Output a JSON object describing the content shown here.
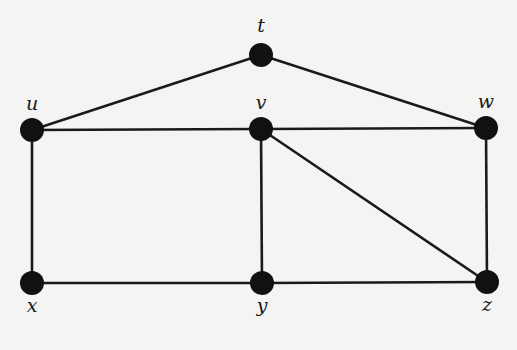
{
  "diagram": {
    "type": "undirected-graph",
    "colors": {
      "background": "#f4f4f2",
      "edge": "#1a1a1a",
      "node": "#111111",
      "label": "#1a1a1a"
    },
    "nodes": [
      {
        "id": "t",
        "label": "t",
        "x": 261,
        "y": 55,
        "lx": 261,
        "ly": 32
      },
      {
        "id": "u",
        "label": "u",
        "x": 32,
        "y": 130,
        "lx": 32,
        "ly": 110
      },
      {
        "id": "v",
        "label": "v",
        "x": 261,
        "y": 129,
        "lx": 261,
        "ly": 109
      },
      {
        "id": "w",
        "label": "w",
        "x": 486,
        "y": 128,
        "lx": 486,
        "ly": 108
      },
      {
        "id": "x",
        "label": "x",
        "x": 32,
        "y": 283,
        "lx": 32,
        "ly": 312
      },
      {
        "id": "y",
        "label": "y",
        "x": 262,
        "y": 283,
        "lx": 262,
        "ly": 312
      },
      {
        "id": "z",
        "label": "z",
        "x": 487,
        "y": 282,
        "lx": 487,
        "ly": 311
      }
    ],
    "edges": [
      [
        "t",
        "u"
      ],
      [
        "t",
        "w"
      ],
      [
        "u",
        "v"
      ],
      [
        "v",
        "w"
      ],
      [
        "u",
        "x"
      ],
      [
        "v",
        "y"
      ],
      [
        "v",
        "z"
      ],
      [
        "w",
        "z"
      ],
      [
        "x",
        "y"
      ],
      [
        "y",
        "z"
      ]
    ]
  }
}
